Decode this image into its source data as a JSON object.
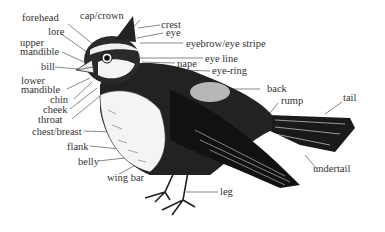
{
  "diagram": {
    "labels": {
      "forehead": "forehead",
      "cap_crown": "cap/crown",
      "crest": "crest",
      "eye": "eye",
      "lore": "lore",
      "upper_mandible_1": "upper",
      "upper_mandible_2": "mandible",
      "eyebrow": "eyebrow/eye stripe",
      "bill": "bill",
      "eye_line": "eye line",
      "nape": "nape",
      "eye_ring": "eye-ring",
      "lower_mandible_1": "lower",
      "lower_mandible_2": "mandible",
      "chin": "chin",
      "cheek": "cheek",
      "throat": "throat",
      "back": "back",
      "rump": "rump",
      "tail": "tail",
      "chest_breast": "chest/breast",
      "flank": "flank",
      "belly": "belly",
      "wing_bar": "wing bar",
      "undertail": "undertail",
      "leg": "leg"
    }
  }
}
